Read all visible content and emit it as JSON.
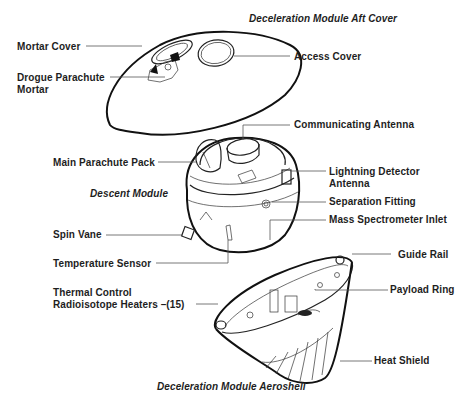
{
  "diagram": {
    "type": "exploded-view",
    "sections": {
      "aft_cover_title": "Deceleration Module Aft Cover",
      "descent_module_title": "Descent Module",
      "aeroshell_title": "Deceleration Module Aeroshell"
    },
    "labels": {
      "mortar_cover": "Mortar Cover",
      "drogue_parachute_mortar": "Drogue Parachute\nMortar",
      "access_cover": "Access Cover",
      "communicating_antenna": "Communicating Antenna",
      "main_parachute_pack": "Main Parachute Pack",
      "lightning_detector_antenna": "Lightning Detector\nAntenna",
      "separation_fitting": "Separation Fitting",
      "mass_spectrometer_inlet": "Mass Spectrometer  Inlet",
      "spin_vane": "Spin Vane",
      "temperature_sensor": "Temperature Sensor",
      "guide_rail": "Guide Rail",
      "thermal_control_heaters": "Thermal Control\nRadioisotope Heaters –(15)",
      "payload_ring": "Payload Ring",
      "heat_shield": "Heat Shield"
    }
  }
}
